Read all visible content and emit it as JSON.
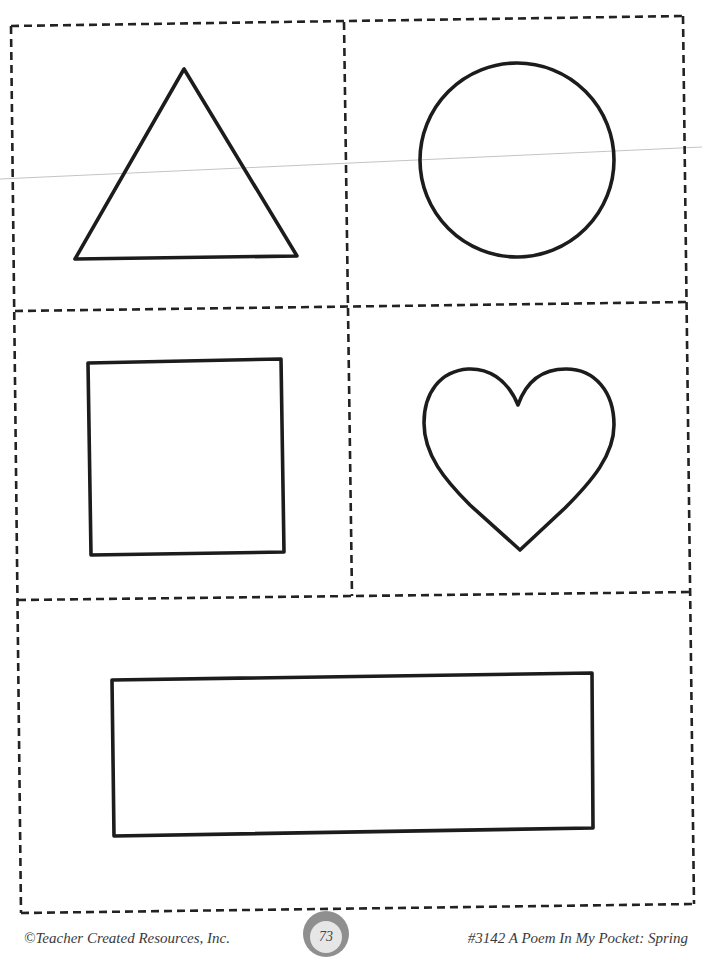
{
  "worksheet": {
    "cards": [
      {
        "position": "top-left",
        "shape": "triangle"
      },
      {
        "position": "top-right",
        "shape": "circle"
      },
      {
        "position": "middle-left",
        "shape": "square"
      },
      {
        "position": "middle-right",
        "shape": "heart"
      },
      {
        "position": "bottom",
        "shape": "rectangle"
      }
    ],
    "border_style": "dashed cut lines",
    "stroke_color": "#1c1c1c"
  },
  "footer": {
    "publisher": "©Teacher Created Resources, Inc.",
    "page_number": "73",
    "book_title": "#3142 A Poem In My Pocket:  Spring",
    "badge_outer_color": "#8f8f8f",
    "badge_inner_color": "#e6e6e6"
  }
}
